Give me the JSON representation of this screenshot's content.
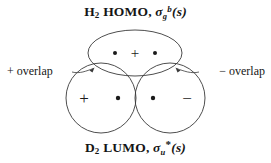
{
  "figure": {
    "type": "orbital-overlap-diagram",
    "background_color": "#ffffff",
    "stroke_color": "#3a3a3a",
    "text_color": "#151515"
  },
  "captions": {
    "top": {
      "molecule": "H",
      "molecule_sub": "2",
      "orbital_type": "HOMO",
      "separator": ", ",
      "symmetry_symbol": "σ",
      "symmetry_sub": "g",
      "symmetry_sup": "b",
      "basis": "(s)",
      "full_text": "H2 HOMO, σg b(s)"
    },
    "bottom": {
      "molecule": "D",
      "molecule_sub": "2",
      "orbital_type": "LUMO",
      "separator": ", ",
      "symmetry_symbol": "σ",
      "symmetry_sub": "u",
      "symmetry_star": "*",
      "basis": "(s)",
      "full_text": "D2 LUMO, σu*(s)"
    }
  },
  "annotations": {
    "left_overlap": "+ overlap",
    "right_overlap": "− overlap"
  },
  "orbitals": {
    "top_lobe": {
      "name": "h2-homo-sigma-g-bonding",
      "shape": "ellipse",
      "cx": 135,
      "cy": 53,
      "rx": 47,
      "ry": 23,
      "signs": [
        "+"
      ],
      "sign_positions": [
        {
          "x": 135,
          "y": 53,
          "label": "+"
        }
      ],
      "nuclei": [
        {
          "x": 115,
          "y": 53
        },
        {
          "x": 155,
          "y": 53
        }
      ]
    },
    "bottom_left_lobe": {
      "name": "d2-lumo-left-lobe",
      "shape": "circle",
      "cx": 101,
      "cy": 98,
      "r": 35,
      "sign": "+",
      "sign_position": {
        "x": 84,
        "y": 98
      },
      "nucleus": {
        "x": 118,
        "y": 98
      }
    },
    "bottom_right_lobe": {
      "name": "d2-lumo-right-lobe",
      "shape": "circle",
      "cx": 170,
      "cy": 98,
      "r": 35,
      "sign": "−",
      "sign_position": {
        "x": 187,
        "y": 98
      },
      "nucleus": {
        "x": 153,
        "y": 98
      }
    }
  },
  "leader_lines": {
    "left": {
      "from": {
        "x": 72,
        "y": 71
      },
      "to": {
        "x": 93,
        "y": 68
      },
      "arrow": true
    },
    "right": {
      "from": {
        "x": 199,
        "y": 71
      },
      "to": {
        "x": 177,
        "y": 68
      },
      "arrow": true
    }
  }
}
